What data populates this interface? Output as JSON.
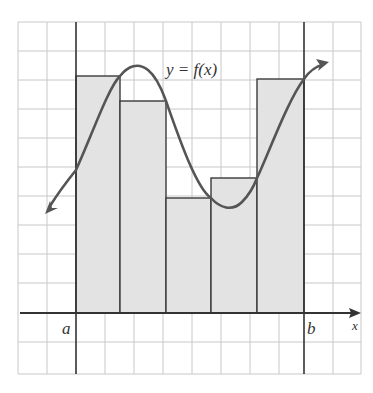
{
  "figure": {
    "curve_label": "y = f(x)",
    "axis_label_x": "x",
    "bound_a_label": "a",
    "bound_b_label": "b",
    "colors": {
      "rect_fill": "#e3e3e3",
      "rect_stroke": "#3a3a3a",
      "curve": "#555555",
      "grid": "#c8c8c8",
      "axis": "#333333"
    },
    "grid": {
      "cell_size_px": 29,
      "columns": 12,
      "rows": 12
    },
    "rectangles": [
      {
        "index": 1,
        "x_start": 0,
        "x_end": 1,
        "height": 8.0
      },
      {
        "index": 2,
        "x_start": 1,
        "x_end": 2,
        "height": 7.2
      },
      {
        "index": 3,
        "x_start": 2,
        "x_end": 3,
        "height": 4.0
      },
      {
        "index": 4,
        "x_start": 3,
        "x_end": 4,
        "height": 4.6
      },
      {
        "index": 5,
        "x_start": 4,
        "x_end": 5,
        "height": 8.0
      }
    ],
    "subintervals": 5
  }
}
